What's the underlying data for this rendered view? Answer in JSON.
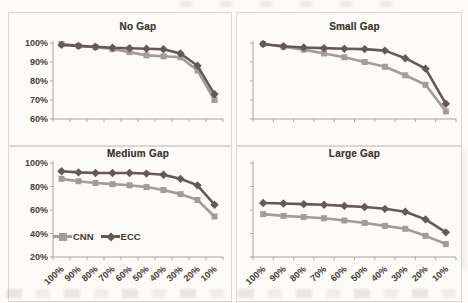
{
  "figure": {
    "legend": {
      "cnn_label": "CNN",
      "ecc_label": "ECC"
    },
    "colors": {
      "cnn": "#a19c97",
      "ecc": "#635a55",
      "axis": "#a9a59e",
      "text": "#46403a",
      "border": "#dad7d0",
      "background": "#fcfbf8"
    }
  },
  "chart_data": [
    {
      "type": "line",
      "title": "No Gap",
      "categories": [
        "100%",
        "90%",
        "80%",
        "70%",
        "60%",
        "50%",
        "40%",
        "30%",
        "20%",
        "10%"
      ],
      "series": [
        {
          "name": "CNN",
          "marker": "square",
          "color_key": "cnn",
          "values": [
            99.5,
            98.5,
            97.8,
            96.8,
            95.2,
            93.5,
            93,
            92.5,
            85.5,
            70
          ]
        },
        {
          "name": "ECC",
          "marker": "diamond",
          "color_key": "ecc",
          "values": [
            99,
            98.5,
            98,
            97.5,
            97.2,
            97,
            96.7,
            94.5,
            88,
            73
          ]
        }
      ],
      "ylim": [
        60,
        100
      ],
      "yticks": [
        60,
        70,
        80,
        90,
        100
      ],
      "ytick_suffix": "%",
      "show_y_labels": true,
      "show_x_labels": false,
      "show_legend": false,
      "grid": false
    },
    {
      "type": "line",
      "title": "Small Gap",
      "categories": [
        "100%",
        "90%",
        "80%",
        "70%",
        "60%",
        "50%",
        "40%",
        "30%",
        "20%",
        "10%"
      ],
      "series": [
        {
          "name": "CNN",
          "marker": "square",
          "color_key": "cnn",
          "values": [
            99.5,
            98,
            96.5,
            94.5,
            92.5,
            90,
            87.5,
            83,
            78,
            64
          ]
        },
        {
          "name": "ECC",
          "marker": "diamond",
          "color_key": "ecc",
          "values": [
            99.5,
            98.3,
            97.6,
            97.3,
            97,
            96.8,
            96,
            92,
            86.5,
            68
          ]
        }
      ],
      "ylim": [
        60,
        100
      ],
      "yticks": [
        60,
        70,
        80,
        90,
        100
      ],
      "ytick_suffix": "%",
      "show_y_labels": false,
      "show_x_labels": false,
      "show_legend": false,
      "grid": false
    },
    {
      "type": "line",
      "title": "Medium Gap",
      "categories": [
        "100%",
        "90%",
        "80%",
        "70%",
        "60%",
        "50%",
        "40%",
        "30%",
        "20%",
        "10%"
      ],
      "series": [
        {
          "name": "CNN",
          "marker": "square",
          "color_key": "cnn",
          "values": [
            86.5,
            84.5,
            83,
            82,
            81,
            79.5,
            77,
            73.5,
            68.5,
            54.5
          ]
        },
        {
          "name": "ECC",
          "marker": "diamond",
          "color_key": "ecc",
          "values": [
            93,
            92,
            91.5,
            91.5,
            91.5,
            91,
            90,
            86.5,
            81,
            64.5
          ]
        }
      ],
      "ylim": [
        20,
        100
      ],
      "yticks": [
        20,
        40,
        60,
        80,
        100
      ],
      "ytick_suffix": "%",
      "show_y_labels": true,
      "show_x_labels": true,
      "show_legend": true,
      "legend_position": "inside-bottom-left",
      "grid": false
    },
    {
      "type": "line",
      "title": "Large Gap",
      "categories": [
        "100%",
        "90%",
        "80%",
        "70%",
        "60%",
        "50%",
        "40%",
        "30%",
        "20%",
        "10%"
      ],
      "series": [
        {
          "name": "CNN",
          "marker": "square",
          "color_key": "cnn",
          "values": [
            56.5,
            55,
            54,
            53,
            51,
            49,
            46.5,
            44,
            38,
            31
          ]
        },
        {
          "name": "ECC",
          "marker": "diamond",
          "color_key": "ecc",
          "values": [
            66,
            65.5,
            65,
            64.5,
            63.5,
            62.5,
            61,
            58.5,
            52,
            41
          ]
        }
      ],
      "ylim": [
        20,
        100
      ],
      "yticks": [
        20,
        40,
        60,
        80,
        100
      ],
      "ytick_suffix": "%",
      "show_y_labels": false,
      "show_x_labels": true,
      "show_legend": false,
      "grid": false
    }
  ]
}
